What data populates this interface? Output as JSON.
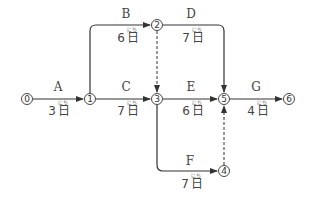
{
  "diagram": {
    "type": "arrow-diagram (PERT)",
    "unit": "日",
    "unit_furigana": "にち",
    "nodes": [
      {
        "id": "0",
        "label": "⓪",
        "x": 27,
        "y": 99
      },
      {
        "id": "1",
        "label": "①",
        "x": 90,
        "y": 99
      },
      {
        "id": "2",
        "label": "②",
        "x": 157,
        "y": 25
      },
      {
        "id": "3",
        "label": "③",
        "x": 157,
        "y": 99
      },
      {
        "id": "4",
        "label": "④",
        "x": 224,
        "y": 171
      },
      {
        "id": "5",
        "label": "⑤",
        "x": 224,
        "y": 99
      },
      {
        "id": "6",
        "label": "⑥",
        "x": 289,
        "y": 99
      }
    ],
    "activities": [
      {
        "name": "A",
        "from": "0",
        "to": "1",
        "duration": "3日",
        "days": 3
      },
      {
        "name": "B",
        "from": "1",
        "to": "2",
        "duration": "6日",
        "days": 6
      },
      {
        "name": "C",
        "from": "1",
        "to": "3",
        "duration": "7日",
        "days": 7
      },
      {
        "name": "D",
        "from": "2",
        "to": "5",
        "duration": "7日",
        "days": 7
      },
      {
        "name": "E",
        "from": "3",
        "to": "5",
        "duration": "6日",
        "days": 6
      },
      {
        "name": "F",
        "from": "3",
        "to": "4",
        "duration": "7日",
        "days": 7
      },
      {
        "name": "G",
        "from": "5",
        "to": "6",
        "duration": "4日",
        "days": 4
      }
    ],
    "dummy_activities": [
      {
        "from": "2",
        "to": "3",
        "style": "dashed"
      },
      {
        "from": "4",
        "to": "5",
        "style": "dashed"
      }
    ],
    "labels": {
      "A": {
        "name": "A",
        "dur_num": "3",
        "dur_unit": "日"
      },
      "B": {
        "name": "B",
        "dur_num": "6",
        "dur_unit": "日"
      },
      "C": {
        "name": "C",
        "dur_num": "7",
        "dur_unit": "日"
      },
      "D": {
        "name": "D",
        "dur_num": "7",
        "dur_unit": "日"
      },
      "E": {
        "name": "E",
        "dur_num": "6",
        "dur_unit": "日"
      },
      "F": {
        "name": "F",
        "dur_num": "7",
        "dur_unit": "日"
      },
      "G": {
        "name": "G",
        "dur_num": "4",
        "dur_unit": "日"
      }
    },
    "node_labels": {
      "n0": "0",
      "n1": "1",
      "n2": "2",
      "n3": "3",
      "n4": "4",
      "n5": "5",
      "n6": "6"
    },
    "colors": {
      "line": "#333333",
      "text": "#444444",
      "background": "#ffffff"
    }
  }
}
